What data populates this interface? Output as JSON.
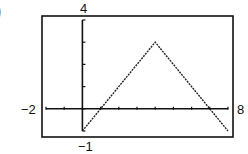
{
  "chart_data": {
    "type": "line",
    "title": "",
    "xlabel": "",
    "ylabel": "",
    "xlim": [
      -2,
      8
    ],
    "ylim": [
      -1,
      4
    ],
    "x_tick_step": 1,
    "y_tick_step": 1,
    "grid": false,
    "window_labels": {
      "xmin": "−2",
      "xmax": "8",
      "ymin": "−1",
      "ymax": "4"
    },
    "series": [
      {
        "name": "f(x)",
        "x": [
          0,
          4,
          8
        ],
        "y": [
          -1,
          3,
          -1
        ]
      }
    ]
  },
  "part_marker": ")"
}
